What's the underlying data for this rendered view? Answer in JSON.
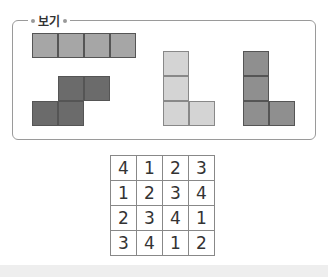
{
  "example_box": {
    "label": "보기",
    "shapes": [
      {
        "name": "I-piece",
        "color": "#a6a6a6"
      },
      {
        "name": "S-piece",
        "color": "#6b6b6b"
      },
      {
        "name": "L-piece-light",
        "color": "#d4d4d4"
      },
      {
        "name": "L-piece-medium",
        "color": "#8f8f8f"
      }
    ]
  },
  "number_grid": {
    "rows": [
      [
        "4",
        "1",
        "2",
        "3"
      ],
      [
        "1",
        "2",
        "3",
        "4"
      ],
      [
        "2",
        "3",
        "4",
        "1"
      ],
      [
        "3",
        "4",
        "1",
        "2"
      ]
    ]
  }
}
